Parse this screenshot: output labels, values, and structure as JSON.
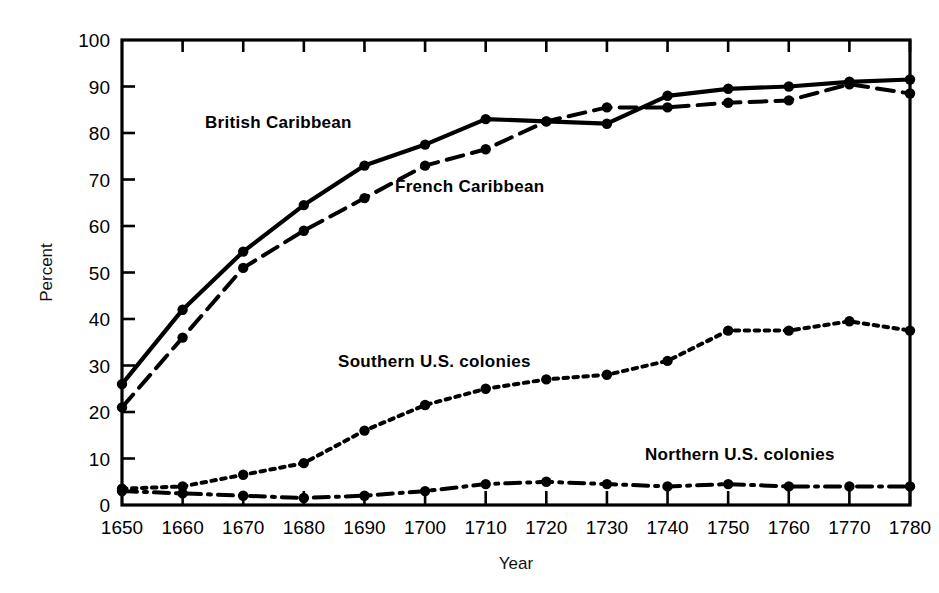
{
  "chart_data": {
    "type": "line",
    "title": "",
    "xlabel": "Year",
    "ylabel": "Percent",
    "xlim": [
      1650,
      1780
    ],
    "ylim": [
      0,
      100
    ],
    "grid": false,
    "legend_position": "inline-annotations",
    "x": [
      1650,
      1660,
      1670,
      1680,
      1690,
      1700,
      1710,
      1720,
      1730,
      1740,
      1750,
      1760,
      1770,
      1780
    ],
    "xticklabels": [
      "1650",
      "1660",
      "1670",
      "1680",
      "1690",
      "1700",
      "1710",
      "1720",
      "1730",
      "1740",
      "1750",
      "1760",
      "1770",
      "1780"
    ],
    "yticks": [
      0,
      10,
      20,
      30,
      40,
      50,
      60,
      70,
      80,
      90,
      100
    ],
    "yticklabels": [
      "0",
      "10",
      "20",
      "30",
      "40",
      "50",
      "60",
      "70",
      "80",
      "90",
      "100"
    ],
    "series": [
      {
        "name": "British Caribbean",
        "style": "solid",
        "marker": "filled-circle",
        "values": [
          26,
          42,
          54.5,
          64.5,
          73,
          77.5,
          83,
          82.5,
          82,
          88,
          89.5,
          90,
          91,
          91.5
        ]
      },
      {
        "name": "French Caribbean",
        "style": "dashed",
        "marker": "filled-circle",
        "values": [
          21,
          36,
          51,
          59,
          66,
          73,
          76.5,
          82.5,
          85.5,
          85.5,
          86.5,
          87,
          90.5,
          88.5
        ]
      },
      {
        "name": "Southern U.S. colonies",
        "style": "dotted",
        "marker": "filled-circle",
        "values": [
          3.5,
          4,
          6.5,
          9,
          16,
          21.5,
          25,
          27,
          28,
          31,
          37.5,
          37.5,
          39.5,
          37.5
        ]
      },
      {
        "name": "Northern U.S. colonies",
        "style": "dash-dot",
        "marker": "filled-circle",
        "values": [
          3,
          2.5,
          2,
          1.5,
          2,
          3,
          4.5,
          5,
          4.5,
          4,
          4.5,
          4,
          4,
          4
        ]
      }
    ],
    "annotations": [
      {
        "text": "British Caribbean",
        "x_px": 205,
        "y_px": 128
      },
      {
        "text": "French Caribbean",
        "x_px": 395,
        "y_px": 192
      },
      {
        "text": "Southern U.S. colonies",
        "x_px": 338,
        "y_px": 367
      },
      {
        "text": "Northern U.S. colonies",
        "x_px": 645,
        "y_px": 460
      }
    ],
    "colors": {
      "line": "#000000",
      "axis": "#000000",
      "background": "#ffffff"
    }
  }
}
